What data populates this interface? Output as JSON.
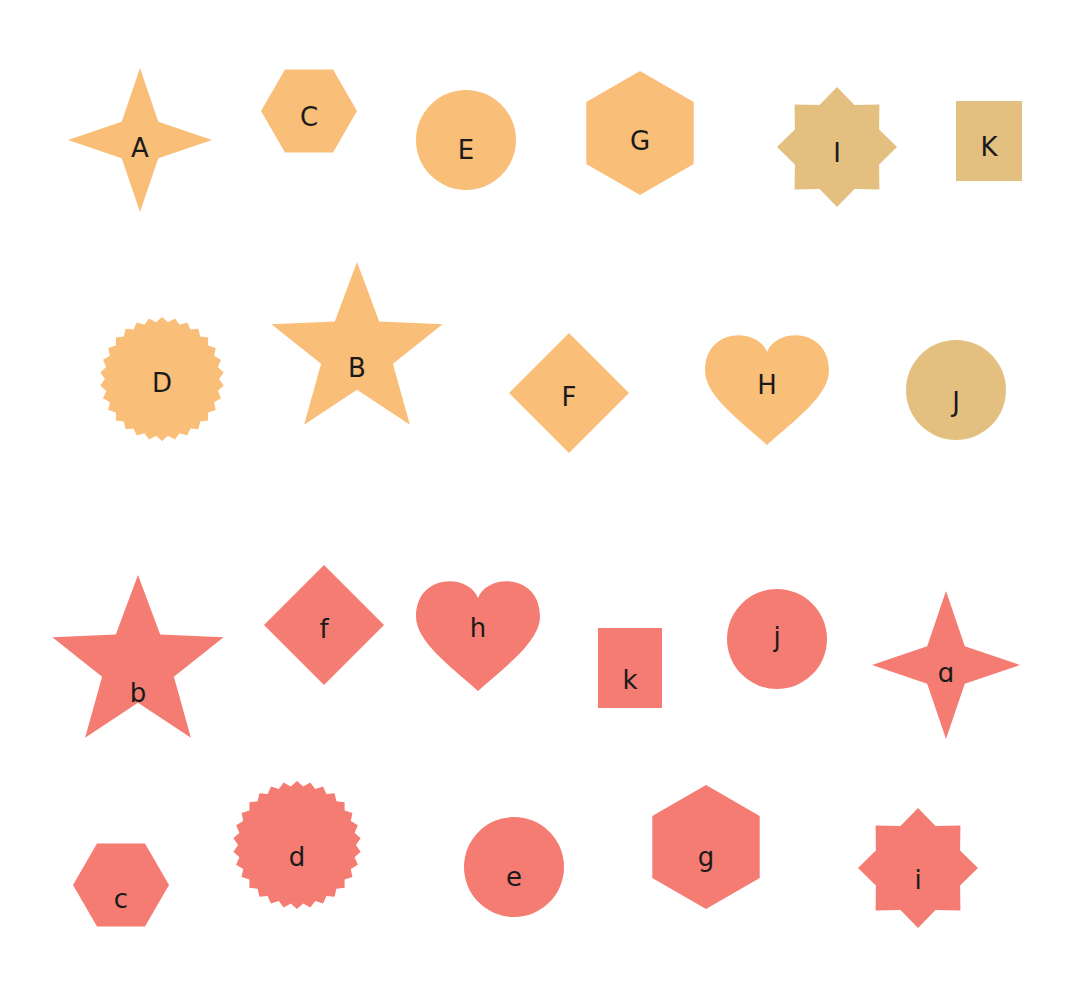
{
  "colors": {
    "orange": "#F9BE78",
    "tan": "#E3C07F",
    "coral": "#F47C72",
    "label": "#1a1a1a",
    "background": "#ffffff"
  },
  "groups": [
    {
      "name": "uppercase",
      "shapes": [
        {
          "letter": "A",
          "shape": "four-point-star",
          "color": "orange"
        },
        {
          "letter": "C",
          "shape": "hexagon-flat",
          "color": "orange"
        },
        {
          "letter": "E",
          "shape": "circle",
          "color": "orange"
        },
        {
          "letter": "G",
          "shape": "hexagon-pointy",
          "color": "orange"
        },
        {
          "letter": "I",
          "shape": "eight-point-star",
          "color": "tan"
        },
        {
          "letter": "K",
          "shape": "rectangle",
          "color": "tan"
        },
        {
          "letter": "D",
          "shape": "seal",
          "color": "orange"
        },
        {
          "letter": "B",
          "shape": "five-point-star",
          "color": "orange"
        },
        {
          "letter": "F",
          "shape": "diamond",
          "color": "orange"
        },
        {
          "letter": "H",
          "shape": "heart",
          "color": "orange"
        },
        {
          "letter": "J",
          "shape": "circle",
          "color": "tan"
        }
      ]
    },
    {
      "name": "lowercase",
      "shapes": [
        {
          "letter": "b",
          "shape": "five-point-star",
          "color": "coral"
        },
        {
          "letter": "f",
          "shape": "diamond",
          "color": "coral"
        },
        {
          "letter": "h",
          "shape": "heart",
          "color": "coral"
        },
        {
          "letter": "k",
          "shape": "rectangle",
          "color": "coral"
        },
        {
          "letter": "j",
          "shape": "circle",
          "color": "coral"
        },
        {
          "letter": "ɑ",
          "shape": "four-point-star",
          "color": "coral"
        },
        {
          "letter": "c",
          "shape": "hexagon-flat",
          "color": "coral"
        },
        {
          "letter": "d",
          "shape": "seal",
          "color": "coral"
        },
        {
          "letter": "e",
          "shape": "circle",
          "color": "coral"
        },
        {
          "letter": "g",
          "shape": "hexagon-pointy",
          "color": "coral"
        },
        {
          "letter": "i",
          "shape": "eight-point-star",
          "color": "coral"
        }
      ]
    }
  ]
}
